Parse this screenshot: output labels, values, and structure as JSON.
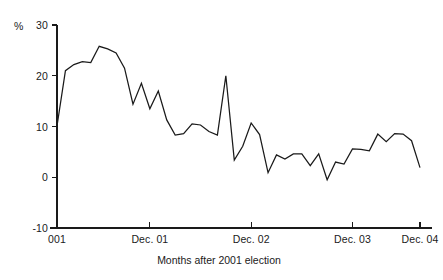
{
  "chart_data": {
    "type": "line",
    "title": "",
    "xlabel": "Months after 2001 election",
    "ylabel": "%",
    "ylim": [
      -10,
      30
    ],
    "xlim": [
      0,
      43
    ],
    "grid": false,
    "legend": null,
    "y_ticks": [
      30,
      20,
      10,
      0,
      -10
    ],
    "y_tick_labels": [
      "30",
      "20",
      "10",
      "0",
      "-10"
    ],
    "x_ticks": [
      0,
      11,
      23,
      35,
      43
    ],
    "x_tick_labels": [
      "001",
      "Dec. 01",
      "Dec. 02",
      "Dec. 03",
      "Dec. 04"
    ],
    "series_name": "Vote intention lead",
    "line_color": "#1a1a1a",
    "x": [
      0,
      1,
      2,
      3,
      4,
      5,
      6,
      7,
      8,
      9,
      10,
      11,
      12,
      13,
      14,
      15,
      16,
      17,
      18,
      19,
      20,
      21,
      22,
      23,
      24,
      25,
      26,
      27,
      28,
      29,
      30,
      31,
      32,
      33,
      34,
      35,
      36,
      37,
      38,
      39,
      40,
      41,
      42,
      43
    ],
    "values": [
      10.1,
      21.0,
      22.2,
      22.8,
      22.6,
      25.8,
      25.3,
      24.5,
      21.5,
      14.4,
      18.5,
      13.5,
      17.0,
      11.3,
      8.3,
      8.6,
      10.5,
      10.3,
      9.0,
      8.3,
      20.0,
      3.4,
      6.1,
      10.7,
      8.4,
      0.9,
      4.4,
      3.6,
      4.6,
      4.6,
      2.3,
      4.6,
      -0.5,
      3.0,
      2.6,
      5.6,
      5.5,
      5.2,
      8.5,
      7.0,
      8.6,
      8.5,
      7.2,
      1.9
    ],
    "x_pixel_range": [
      57,
      420
    ],
    "y_pixel_map": {
      "30": 25,
      "20": 70,
      "10": 122,
      "0": 172,
      "-10": 228
    }
  },
  "labels": {
    "unit": "%",
    "axis_title": "Months after 2001 election"
  }
}
